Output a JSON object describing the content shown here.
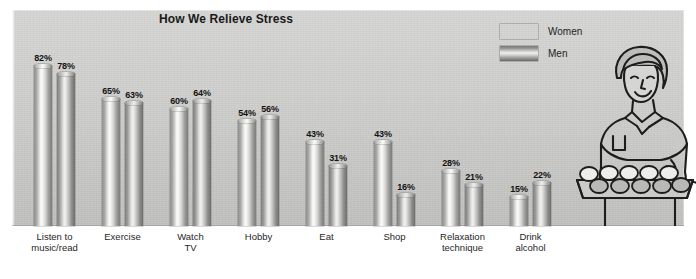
{
  "chart_data": {
    "type": "bar",
    "title": "How We Relieve Stress",
    "xlabel": "",
    "ylabel": "",
    "ylim": [
      0,
      100
    ],
    "grid": false,
    "legend_position": "top-right",
    "value_suffix": "%",
    "categories": [
      "Listen to\nmusic/read",
      "Exercise",
      "Watch\nTV",
      "Hobby",
      "Eat",
      "Shop",
      "Relaxation\ntechnique",
      "Drink\nalcohol"
    ],
    "series": [
      {
        "name": "Women",
        "values": [
          82,
          65,
          60,
          54,
          43,
          43,
          28,
          15
        ]
      },
      {
        "name": "Men",
        "values": [
          78,
          63,
          64,
          56,
          31,
          16,
          21,
          22
        ]
      }
    ],
    "labels": {
      "women": [
        "82%",
        "65%",
        "60%",
        "54%",
        "43%",
        "43%",
        "28%",
        "15%"
      ],
      "men": [
        "78%",
        "63%",
        "64%",
        "56%",
        "31%",
        "16%",
        "21%",
        "22%"
      ]
    }
  },
  "legend": {
    "items": [
      {
        "label": "Women",
        "swatch": "cylinder-gradient-light"
      },
      {
        "label": "Men",
        "swatch": "cylinder-gradient-dark"
      }
    ]
  },
  "illustration": {
    "name": "woman-holding-tray-of-muffins",
    "description": "Line drawing of a smiling woman carrying a baking tray of muffins"
  },
  "caption": {
    "text": ""
  },
  "colors": {
    "panel_background": "#cfcfcd",
    "bar_light": "#fbfbfa",
    "bar_dark": "#7b7b79",
    "text": "#1a1a1a"
  }
}
